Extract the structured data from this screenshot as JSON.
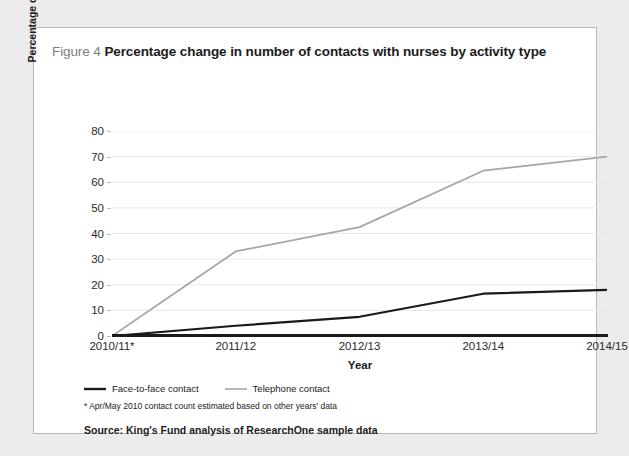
{
  "figure": {
    "label": "Figure 4",
    "title": "Percentage change in number of contacts with nurses by activity type",
    "footnote": "* Apr/May 2010 contact count estimated based on other years' data",
    "source": "Source: King's Fund analysis of ResearchOne sample data"
  },
  "colors": {
    "face_to_face": "#1a1a1a",
    "telephone": "#a6a6a6",
    "gridline": "#e8e8e8",
    "axis": "#1a1a1a",
    "card_border": "#b9b9bb",
    "page_background": "#ececed"
  },
  "chart_data": {
    "type": "line",
    "title": "Percentage change in number of contacts with nurses by activity type",
    "xlabel": "Year",
    "ylabel": "Percentage change in number of contacts",
    "categories": [
      "2010/11*",
      "2011/12",
      "2012/13",
      "2013/14",
      "2014/15"
    ],
    "yticks": [
      0,
      10,
      20,
      30,
      40,
      50,
      60,
      70,
      80
    ],
    "ylim": [
      0,
      80
    ],
    "grid": true,
    "legend_position": "below-plot-left",
    "series": [
      {
        "name": "Face-to-face contact",
        "color": "#1a1a1a",
        "values": [
          0,
          4,
          7.5,
          16.5,
          18
        ]
      },
      {
        "name": "Telephone contact",
        "color": "#a6a6a6",
        "values": [
          0,
          33,
          42.5,
          64.5,
          70
        ]
      }
    ]
  }
}
